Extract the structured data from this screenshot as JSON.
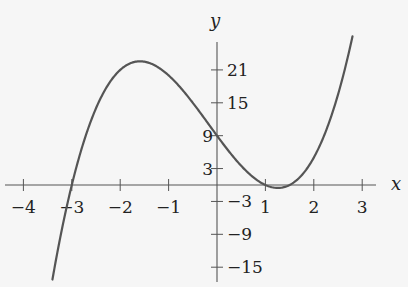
{
  "chart_data": {
    "type": "line",
    "title": "",
    "xlabel": "x",
    "ylabel": "y",
    "function": "y = 2(x+3)(x-1)(x-1.5)",
    "xlim": [
      -4.4,
      3.3
    ],
    "ylim": [
      -17.5,
      26.5
    ],
    "x_ticks": [
      -4,
      -3,
      -2,
      -1,
      1,
      2,
      3
    ],
    "x_tick_labels": [
      "−4",
      "−3",
      "−2",
      "−1",
      "1",
      "2",
      "3"
    ],
    "y_ticks": [
      21,
      15,
      9,
      3,
      -3,
      -9,
      -15
    ],
    "y_tick_labels": [
      "21",
      "15",
      "9",
      "3",
      "−3",
      "−9",
      "−15"
    ],
    "grid": false,
    "legend": null,
    "series": [
      {
        "name": "f(x)",
        "x": [
          -3.4,
          -3.0,
          -2.5,
          -2.0,
          -1.5,
          -1.0,
          -0.5,
          0.0,
          0.5,
          1.0,
          1.25,
          1.5,
          2.0,
          2.5,
          2.8
        ],
        "values": [
          -17.2,
          0,
          12.25,
          21.0,
          22.5,
          20.0,
          15.0,
          9.0,
          3.5,
          0,
          -0.53,
          0,
          5.0,
          16.5,
          27.1
        ]
      }
    ],
    "annotations": {
      "roots": [
        -3,
        1,
        1.5
      ],
      "y_intercept": 9,
      "local_max": {
        "x": -1.5,
        "y": 22.5
      }
    }
  },
  "style": {
    "background": "#f6f6f6",
    "axis_color": "#555555",
    "curve_color": "#555555",
    "text_color": "#222222"
  }
}
